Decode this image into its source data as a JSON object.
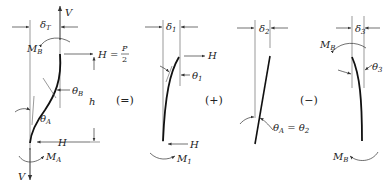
{
  "diagram": {
    "operators": [
      "(=)",
      "(+)",
      "(−)"
    ],
    "panel_main": {
      "labels": {
        "V_top": "V",
        "delta": "δ",
        "delta_sub": "T",
        "MB": "M",
        "MB_sub": "B",
        "H_eq": "H = ",
        "P": "P",
        "two": "2",
        "thetaB": "θ",
        "thetaB_sub": "B",
        "h": "h",
        "thetaA": "θ",
        "thetaA_sub": "A",
        "H_bottom": "H",
        "MA": "M",
        "MA_sub": "A",
        "V_bottom": "V"
      }
    },
    "panel_1": {
      "labels": {
        "delta": "δ",
        "delta_sub": "1",
        "H_top": "H",
        "theta": "θ",
        "theta_sub": "1",
        "H_bottom": "H",
        "M": "M",
        "M_sub": "1"
      }
    },
    "panel_2": {
      "labels": {
        "delta": "δ",
        "delta_sub": "2",
        "theta_eq": "θ",
        "theta_eq_sub": "A",
        "equals": " = θ",
        "theta2_sub": "2"
      }
    },
    "panel_3": {
      "labels": {
        "delta": "δ",
        "delta_sub": "3",
        "MB_top": "M",
        "MB_top_sub": "B",
        "theta": "θ",
        "theta_sub": "3",
        "MB_bottom": "M",
        "MB_bottom_sub": "B"
      }
    }
  }
}
